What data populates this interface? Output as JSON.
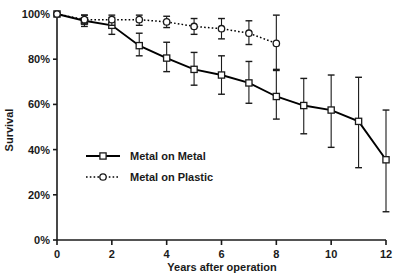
{
  "chart_data": {
    "type": "line",
    "title": "",
    "xlabel": "Years after operation",
    "ylabel": "Survival",
    "xlim": [
      0,
      12
    ],
    "ylim": [
      0,
      100
    ],
    "grid": false,
    "legend_position": "inside-left",
    "x_ticks": [
      "0",
      "2",
      "4",
      "6",
      "8",
      "10",
      "12"
    ],
    "x_tick_values": [
      0,
      2,
      4,
      6,
      8,
      10,
      12
    ],
    "y_ticks": [
      "0%",
      "20%",
      "40%",
      "60%",
      "80%",
      "100%"
    ],
    "y_tick_values": [
      0,
      20,
      40,
      60,
      80,
      100
    ],
    "series": [
      {
        "name": "Metal on Metal",
        "marker": "square",
        "line_style": "solid",
        "color": "#000000",
        "x": [
          0,
          1,
          2,
          3,
          4,
          5,
          6,
          7,
          8,
          9,
          10,
          11,
          12
        ],
        "values": [
          100,
          97,
          95,
          86,
          80.5,
          75.5,
          73,
          69.5,
          63.5,
          59.5,
          57.5,
          52.5,
          35.5
        ],
        "err_low": [
          100,
          94.5,
          91,
          81.5,
          74.5,
          68.5,
          64.5,
          60.5,
          53.5,
          47,
          41,
          32,
          12.5
        ],
        "err_high": [
          100,
          99.5,
          98.5,
          91.5,
          87.5,
          83,
          81.5,
          79,
          75,
          71.5,
          73,
          72,
          57.5
        ]
      },
      {
        "name": "Metal on Plastic",
        "marker": "circle",
        "line_style": "dotted",
        "color": "#000000",
        "x": [
          0,
          1,
          2,
          3,
          4,
          5,
          6,
          7,
          8
        ],
        "values": [
          100,
          97.5,
          97.5,
          97.5,
          96.5,
          94.5,
          93.5,
          91.5,
          87
        ],
        "err_low": [
          100,
          95.5,
          95,
          95,
          94,
          91,
          89,
          86.5,
          75.5
        ],
        "err_high": [
          100,
          99.5,
          99.5,
          99.5,
          99,
          98,
          98,
          97,
          99.5
        ]
      }
    ]
  },
  "legend": {
    "items": [
      {
        "label": "Metal on Metal"
      },
      {
        "label": "Metal on Plastic"
      }
    ]
  }
}
